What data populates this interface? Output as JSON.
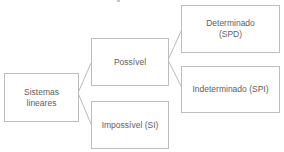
{
  "diagram": {
    "type": "tree",
    "direction": "left-to-right",
    "nodes": [
      {
        "id": "root",
        "label_lines": [
          "Sistemas",
          "lineares"
        ]
      },
      {
        "id": "possivel",
        "label_lines": [
          "Possível"
        ]
      },
      {
        "id": "impossivel",
        "label_lines": [
          "Impossível (SI)"
        ]
      },
      {
        "id": "determinado",
        "label_lines": [
          "Determinado",
          "(SPD)"
        ]
      },
      {
        "id": "indeterminado",
        "label_lines": [
          "Indeterminado (SPI)"
        ]
      }
    ],
    "edges": [
      {
        "from": "root",
        "to": "possivel"
      },
      {
        "from": "root",
        "to": "impossivel"
      },
      {
        "from": "possivel",
        "to": "determinado"
      },
      {
        "from": "possivel",
        "to": "indeterminado"
      }
    ],
    "colors": {
      "border": "#bdbdbd",
      "line": "#a8a8a8",
      "text": "#5e5e5e",
      "background": "#ffffff"
    }
  }
}
